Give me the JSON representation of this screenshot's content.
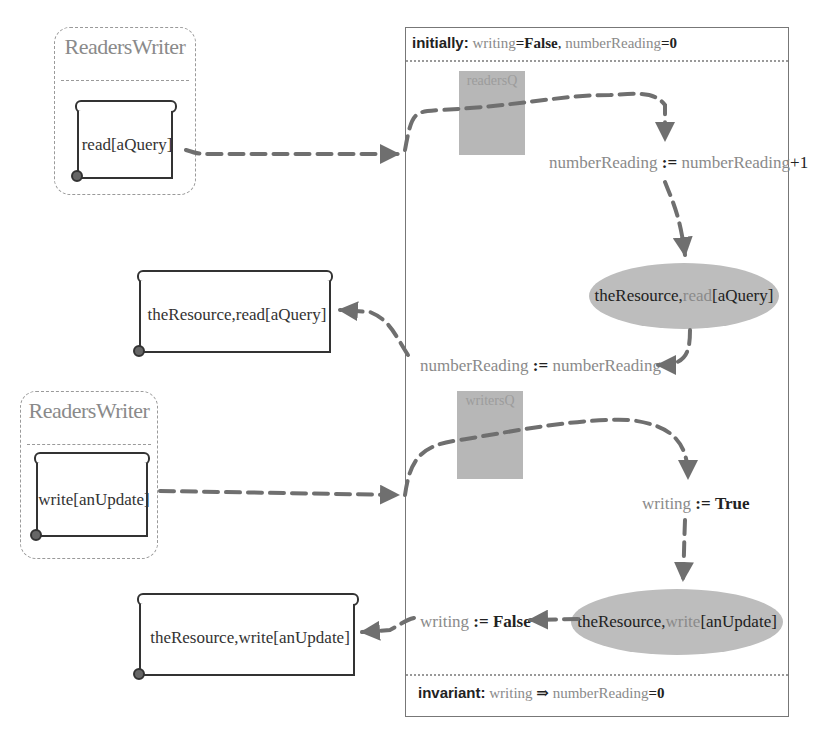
{
  "panel": {
    "initially": {
      "keyword": "initially:",
      "var1": "writing",
      "val1": "=False",
      "sep": ",",
      "var2": "numberReading",
      "val2": "=0"
    },
    "invariant": {
      "keyword": "invariant:",
      "var1": "writing",
      "implies": "⇒",
      "var2": "numberReading",
      "val2": "=0"
    },
    "read_flow": {
      "queue_label": "readersQ",
      "pre_stmt": {
        "lhs": "numberReading",
        "op": ":=",
        "rhs": "numberReading",
        "suffix": "+1"
      },
      "action": {
        "obj": "theResource,",
        "method": "read",
        "arg": "[aQuery]"
      },
      "post_stmt": {
        "lhs": "numberReading",
        "op": ":=",
        "rhs": "numberReading",
        "suffix": "-1"
      }
    },
    "write_flow": {
      "queue_label": "writersQ",
      "pre_stmt": {
        "lhs": "writing",
        "op": ":=",
        "val": "True"
      },
      "action": {
        "obj": "theResource,",
        "method": "write",
        "arg": "[anUpdate]"
      },
      "post_stmt": {
        "lhs": "writing",
        "op": ":=",
        "val": "False"
      }
    }
  },
  "clients": [
    {
      "title": "ReadersWriter",
      "message": "read[aQuery]"
    },
    {
      "title": "ReadersWriter",
      "message": "write[anUpdate]"
    }
  ],
  "responses": [
    {
      "message": "theResource,read[aQuery]"
    },
    {
      "message": "theResource,write[anUpdate]"
    }
  ],
  "colors": {
    "arrow": "#6f6f6f",
    "queue_fill": "#b7b7b7",
    "ellipse_fill": "#bdbdbd",
    "text_gray": "#8a8a8a",
    "text_dark": "#222222"
  }
}
